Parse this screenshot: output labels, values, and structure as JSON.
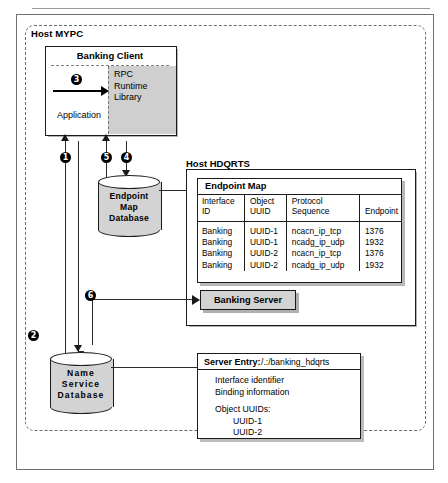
{
  "figure": {
    "outer_label": "Host MYPC",
    "right_label": "Host HDQRTS"
  },
  "banking_client": {
    "title": "Banking Client",
    "application_label": "Application",
    "rpc_line1": "RPC",
    "rpc_line2": "Runtime",
    "rpc_line3": "Library"
  },
  "steps": {
    "s1": "1",
    "s2": "2",
    "s3": "3",
    "s4": "4",
    "s5": "5",
    "s6": "6"
  },
  "endpoint_map_db": {
    "line1": "Endpoint",
    "line2": "Map",
    "line3": "Database"
  },
  "name_service_db": {
    "line1": "Name",
    "line2": "Service",
    "line3": "Database"
  },
  "endpoint_map": {
    "title": "Endpoint Map",
    "headers": [
      "Interface\nID",
      "Object\nUUID",
      "Protocol\nSequence",
      "Endpoint"
    ],
    "header_cells": {
      "interface_id_1": "Interface",
      "interface_id_2": "ID",
      "object_uuid_1": "Object",
      "object_uuid_2": "UUID",
      "protocol_seq_1": "Protocol",
      "protocol_seq_2": "Sequence",
      "endpoint": "Endpoint"
    },
    "rows": [
      {
        "interface_id": "Banking",
        "object_uuid": "UUID-1",
        "protocol_sequence": "ncacn_ip_tcp",
        "endpoint": "1376"
      },
      {
        "interface_id": "Banking",
        "object_uuid": "UUID-1",
        "protocol_sequence": "ncadg_ip_udp",
        "endpoint": "1932"
      },
      {
        "interface_id": "Banking",
        "object_uuid": "UUID-2",
        "protocol_sequence": "ncacn_ip_tcp",
        "endpoint": "1376"
      },
      {
        "interface_id": "Banking",
        "object_uuid": "UUID-2",
        "protocol_sequence": "ncadg_ip_udp",
        "endpoint": "1932"
      }
    ]
  },
  "banking_server": {
    "label": "Banking Server"
  },
  "server_entry": {
    "key": "Server Entry:",
    "path": "/.:/banking_hdqrts",
    "line1": "Interface identifier",
    "line2": "Binding information",
    "line3": "Object UUIDs:",
    "uuid1": "UUID-1",
    "uuid2": "UUID-2"
  },
  "colors": {
    "ink": "#1a1a1a",
    "shade": "#d3d3d3",
    "shadow": "#b4b4b4",
    "frame": "#6f6f6f"
  }
}
